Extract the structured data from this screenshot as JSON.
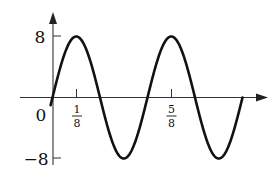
{
  "chart_data": {
    "type": "line",
    "title": "",
    "xlabel": "",
    "ylabel": "",
    "function": "y = 8 sin(4πx)",
    "xlim": [
      -0.17,
      1.13
    ],
    "ylim": [
      -8,
      8
    ],
    "grid": false,
    "legend": null,
    "y_ticks": [
      {
        "value": 8,
        "label": "8"
      },
      {
        "value": -8,
        "label": "−8"
      }
    ],
    "x_ticks": [
      {
        "value": 0.125,
        "label_num": "1",
        "label_den": "8"
      },
      {
        "value": 0.625,
        "label_num": "5",
        "label_den": "8"
      }
    ],
    "origin_label": "0",
    "series": [
      {
        "name": "sinusoid",
        "amplitude": 8,
        "period": 0.5,
        "x_start": -0.01,
        "x_end": 1.0,
        "x": [
          0,
          0.0625,
          0.125,
          0.1875,
          0.25,
          0.3125,
          0.375,
          0.4375,
          0.5,
          0.5625,
          0.625,
          0.6875,
          0.75,
          0.8125,
          0.875,
          0.9375,
          1.0
        ],
        "values": [
          0,
          5.66,
          8,
          5.66,
          0,
          -5.66,
          -8,
          -5.66,
          0,
          5.66,
          8,
          5.66,
          0,
          -5.66,
          -8,
          -5.66,
          0
        ]
      }
    ]
  },
  "colors": {
    "curve": "#111111",
    "axes": "#333333",
    "background": "#ffffff"
  }
}
